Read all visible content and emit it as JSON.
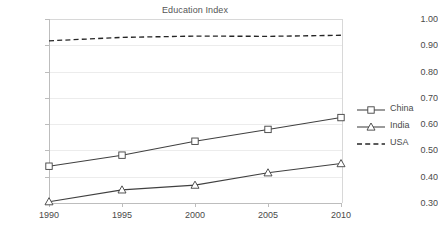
{
  "chart_data": {
    "type": "line",
    "title": "Education Index",
    "xlabel": "",
    "ylabel": "",
    "x": [
      1990,
      1995,
      2000,
      2005,
      2010
    ],
    "xtick_labels": [
      "1990",
      "1995",
      "2000",
      "2005",
      "2010"
    ],
    "ytick_labels": [
      "0.30",
      "0.40",
      "0.50",
      "0.60",
      "0.70",
      "0.80",
      "0.90",
      "1.00"
    ],
    "ylim": [
      0.3,
      1.0
    ],
    "ytick_step": 0.1,
    "grid": true,
    "legend_position": "right",
    "series": [
      {
        "name": "China",
        "values": [
          0.44,
          0.482,
          0.535,
          0.58,
          0.625
        ],
        "marker": "square",
        "linestyle": "solid",
        "color": "#404040"
      },
      {
        "name": "India",
        "values": [
          0.305,
          0.35,
          0.368,
          0.415,
          0.45
        ],
        "marker": "triangle",
        "linestyle": "solid",
        "color": "#404040"
      },
      {
        "name": "USA",
        "values": [
          0.917,
          0.93,
          0.935,
          0.934,
          0.938
        ],
        "marker": "none",
        "linestyle": "dashed",
        "color": "#262626"
      }
    ]
  },
  "legend": {
    "items": [
      {
        "label": "China",
        "marker": "square-marker-icon",
        "linestyle": "solid"
      },
      {
        "label": "India",
        "marker": "triangle-marker-icon",
        "linestyle": "solid"
      },
      {
        "label": "USA",
        "marker": "none",
        "linestyle": "dashed"
      }
    ]
  },
  "colors": {
    "line": "#404040",
    "grid": "#ececec",
    "axis": "#bdbdbd",
    "text": "#4a4a4a",
    "title": "#555555",
    "background": "#ffffff"
  }
}
